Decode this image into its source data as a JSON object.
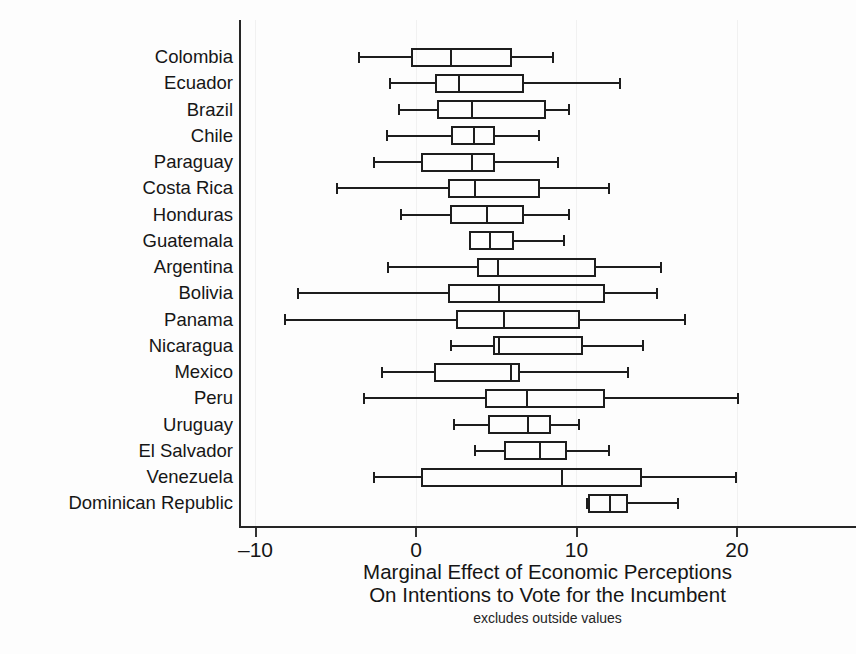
{
  "chart_data": {
    "type": "box",
    "title": "",
    "xlabel": "Marginal Effect of Economic Perceptions On Intentions to Vote for the Incumbent",
    "xlabel_line1": "Marginal Effect of Economic Perceptions",
    "xlabel_line2": "On Intentions to Vote for the Incumbent",
    "note": "excludes outside values",
    "ylabel": "",
    "xlim": [
      -11.0,
      21.5
    ],
    "xticks": [
      -10,
      0,
      10,
      20
    ],
    "xtick_labels": [
      "–10",
      "0",
      "10",
      "20"
    ],
    "grid": false,
    "legend": null,
    "orientation": "horizontal",
    "categories": [
      "Colombia",
      "Ecuador",
      "Brazil",
      "Chile",
      "Paraguay",
      "Costa Rica",
      "Honduras",
      "Guatemala",
      "Argentina",
      "Bolivia",
      "Panama",
      "Nicaragua",
      "Mexico",
      "Peru",
      "Uruguay",
      "El Salvador",
      "Venezuela",
      "Dominican Republic"
    ],
    "boxes": [
      {
        "category": "Colombia",
        "whisker_low": -3.6,
        "q1": -0.3,
        "median": 2.2,
        "q3": 6.0,
        "whisker_high": 8.6
      },
      {
        "category": "Ecuador",
        "whisker_low": -1.7,
        "q1": 1.2,
        "median": 2.7,
        "q3": 6.7,
        "whisker_high": 12.8
      },
      {
        "category": "Brazil",
        "whisker_low": -1.1,
        "q1": 1.3,
        "median": 3.5,
        "q3": 8.1,
        "whisker_high": 9.6
      },
      {
        "category": "Chile",
        "whisker_low": -1.9,
        "q1": 2.2,
        "median": 3.6,
        "q3": 4.9,
        "whisker_high": 7.7
      },
      {
        "category": "Paraguay",
        "whisker_low": -2.7,
        "q1": 0.3,
        "median": 3.5,
        "q3": 4.9,
        "whisker_high": 8.9
      },
      {
        "category": "Costa Rica",
        "whisker_low": -5.0,
        "q1": 2.0,
        "median": 3.7,
        "q3": 7.7,
        "whisker_high": 12.1
      },
      {
        "category": "Honduras",
        "whisker_low": -1.0,
        "q1": 2.1,
        "median": 4.4,
        "q3": 6.7,
        "whisker_high": 9.6
      },
      {
        "category": "Guatemala",
        "whisker_low": 3.3,
        "q1": 3.3,
        "median": 4.6,
        "q3": 6.1,
        "whisker_high": 9.3
      },
      {
        "category": "Argentina",
        "whisker_low": -1.8,
        "q1": 3.8,
        "median": 5.1,
        "q3": 11.2,
        "whisker_high": 15.3
      },
      {
        "category": "Bolivia",
        "whisker_low": -7.4,
        "q1": 2.0,
        "median": 5.2,
        "q3": 11.8,
        "whisker_high": 15.1
      },
      {
        "category": "Panama",
        "whisker_low": -8.2,
        "q1": 2.5,
        "median": 5.5,
        "q3": 10.2,
        "whisker_high": 16.8
      },
      {
        "category": "Nicaragua",
        "whisker_low": 2.1,
        "q1": 4.8,
        "median": 5.2,
        "q3": 10.4,
        "whisker_high": 14.2
      },
      {
        "category": "Mexico",
        "whisker_low": -2.2,
        "q1": 1.1,
        "median": 5.9,
        "q3": 6.5,
        "whisker_high": 13.3
      },
      {
        "category": "Peru",
        "whisker_low": -3.3,
        "q1": 4.3,
        "median": 6.9,
        "q3": 11.8,
        "whisker_high": 20.1
      },
      {
        "category": "Uruguay",
        "whisker_low": 2.3,
        "q1": 4.5,
        "median": 7.0,
        "q3": 8.4,
        "whisker_high": 10.2
      },
      {
        "category": "El Salvador",
        "whisker_low": 3.6,
        "q1": 5.5,
        "median": 7.7,
        "q3": 9.4,
        "whisker_high": 12.1
      },
      {
        "category": "Venezuela",
        "whisker_low": -2.7,
        "q1": 0.3,
        "median": 9.1,
        "q3": 14.1,
        "whisker_high": 20.0
      },
      {
        "category": "Dominican Republic",
        "whisker_low": 10.6,
        "q1": 10.7,
        "median": 12.1,
        "q3": 13.2,
        "whisker_high": 16.4
      }
    ]
  },
  "axis": {
    "x_tick_labels": [
      "–10",
      "0",
      "10",
      "20"
    ]
  }
}
